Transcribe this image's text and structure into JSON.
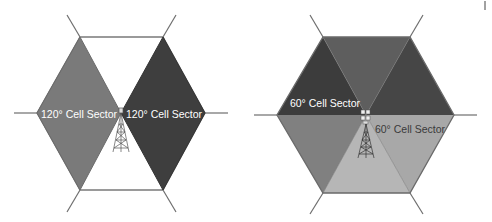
{
  "diagrams": [
    {
      "name": "120-degree-sectorization",
      "sectors": [
        {
          "label": "120° Cell Sector",
          "color": "#7a7a7a",
          "text_color": "#ffffff"
        },
        {
          "label": "120° Cell Sector",
          "color": "#3e3e3e",
          "text_color": "#ffffff"
        }
      ],
      "unfilled_region_color": "#ffffff",
      "outline_color": "#6e6e6e",
      "tower": "cell-tower-icon"
    },
    {
      "name": "60-degree-sectorization",
      "sectors": [
        {
          "label": "60° Cell Sector",
          "color": "#3c3c3c",
          "text_color": "#ffffff",
          "position": "upper-left"
        },
        {
          "label": "",
          "color": "#5e5e5e",
          "position": "top"
        },
        {
          "label": "",
          "color": "#464646",
          "position": "upper-right"
        },
        {
          "label": "60° Cell Sector",
          "color": "#a8a8a8",
          "text_color": "#3a3a3a",
          "position": "lower-right"
        },
        {
          "label": "",
          "color": "#b6b6b6",
          "position": "bottom"
        },
        {
          "label": "",
          "color": "#808080",
          "position": "lower-left"
        }
      ],
      "outline_color": "#6e6e6e",
      "tower": "cell-tower-icon"
    }
  ]
}
